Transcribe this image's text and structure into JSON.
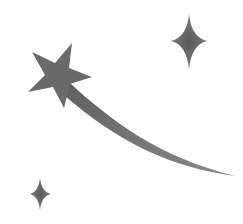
{
  "illustration": {
    "subject": "shooting star with sparkles",
    "elements": [
      "shooting-star",
      "star-tail",
      "sparkle-large",
      "sparkle-small"
    ]
  },
  "colors": {
    "background": "#ffffff",
    "fill": "#6e6e6e",
    "fill_dark": "#5e5e5e"
  }
}
